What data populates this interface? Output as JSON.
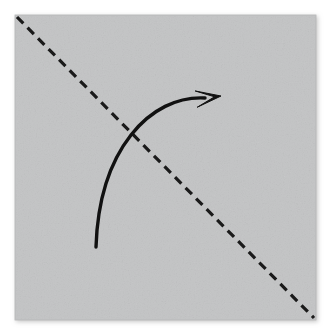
{
  "figure": {
    "canvas": {
      "width": 331,
      "height": 336,
      "background": "#ffffff"
    },
    "paper": {
      "label": "square paper sheet",
      "shape": "square",
      "x": 15,
      "y": 15,
      "width": 301,
      "height": 305,
      "fill": "#c3c4c5",
      "edge_color": "#b3b4b5",
      "shadow_color": "#d9d9d9"
    },
    "fold_line": {
      "label": "diagonal valley fold crease",
      "style": "dashed",
      "color": "#1a1a1a",
      "stroke_width": 3.2,
      "dash_length": 9,
      "dash_gap": 6,
      "from": {
        "x": 17,
        "y": 17
      },
      "to": {
        "x": 314,
        "y": 318
      }
    },
    "fold_arrow": {
      "label": "curved fold direction arrow",
      "color": "#111111",
      "stroke_width": 3.4,
      "tail": {
        "x": 96,
        "y": 247
      },
      "control_1": {
        "x": 99,
        "y": 150
      },
      "control_2": {
        "x": 150,
        "y": 95
      },
      "head_base": {
        "x": 205,
        "y": 98
      },
      "tip": {
        "x": 221,
        "y": 96
      },
      "arrowhead_style": "solid-triangle-barbed"
    }
  },
  "chart_data": {
    "type": "diagram",
    "elements": [
      {
        "name": "paper-square",
        "type": "square",
        "fill": "#c3c4c5",
        "bbox": [
          15,
          15,
          316,
          320
        ]
      },
      {
        "name": "diagonal-fold-crease",
        "type": "dashed-line",
        "points": [
          [
            17,
            17
          ],
          [
            314,
            318
          ]
        ]
      },
      {
        "name": "fold-direction-arrow",
        "type": "curved-arrow",
        "points": [
          [
            96,
            247
          ],
          [
            221,
            96
          ]
        ]
      }
    ]
  }
}
